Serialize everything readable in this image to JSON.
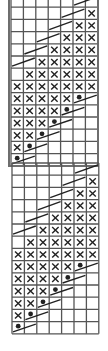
{
  "chart": {
    "columns": 7,
    "cell_width": 12.4,
    "cell_height": 12.2,
    "colors": {
      "grid": "#555555",
      "frame": "#6e6e6e",
      "symbol": "#222222",
      "background": "#ffffff"
    },
    "legend_codes": {
      "": "empty stitch",
      "X": "cross stitch",
      "S": "diagonal slash",
      "D": "dot with slash"
    },
    "rows": [
      [
        "",
        "",
        "",
        "",
        "",
        "S",
        ""
      ],
      [
        "",
        "",
        "",
        "",
        "S",
        "",
        "X"
      ],
      [
        "",
        "",
        "",
        "S",
        "",
        "X",
        "X"
      ],
      [
        "",
        "",
        "S",
        "",
        "X",
        "X",
        "X"
      ],
      [
        "",
        "S",
        "",
        "X",
        "X",
        "X",
        "X"
      ],
      [
        "S",
        "",
        "X",
        "X",
        "X",
        "X",
        "X"
      ],
      [
        "",
        "X",
        "X",
        "X",
        "X",
        "X",
        "X"
      ],
      [
        "X",
        "X",
        "X",
        "X",
        "X",
        "X",
        "X"
      ],
      [
        "X",
        "X",
        "X",
        "X",
        "X",
        "D",
        ""
      ],
      [
        "X",
        "X",
        "X",
        "X",
        "D",
        "",
        ""
      ],
      [
        "X",
        "X",
        "X",
        "D",
        "",
        "",
        ""
      ],
      [
        "X",
        "X",
        "D",
        "",
        "",
        "",
        ""
      ],
      [
        "X",
        "D",
        "",
        "",
        "",
        "",
        ""
      ],
      [
        "D",
        "",
        "",
        "",
        "",
        "",
        ""
      ]
    ],
    "sections": [
      {
        "name": "repeat-framed",
        "left": 10,
        "top": -6.3,
        "framed": true
      },
      {
        "name": "repeat-lower",
        "left": 11,
        "top": 162,
        "framed": false
      }
    ]
  }
}
